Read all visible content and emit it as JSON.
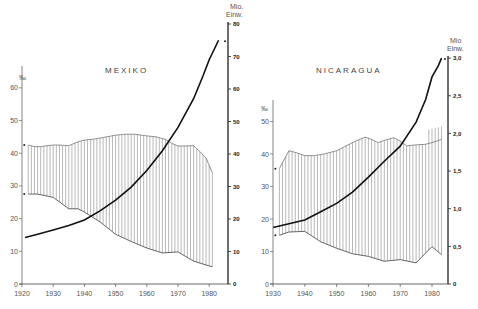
{
  "chart_data": [
    {
      "type": "line",
      "title": "MEXIKO",
      "xlabel": "",
      "ylabel_left": "‰",
      "ylabel_right": "Mio. Einw.",
      "x_ticks": [
        1920,
        1930,
        1940,
        1950,
        1960,
        1970,
        1980
      ],
      "y_left_ticks": [
        0,
        10,
        20,
        30,
        40,
        50,
        60
      ],
      "y_left_range": [
        0,
        60
      ],
      "y_right_ticks": [
        0,
        10,
        20,
        30,
        40,
        50,
        60,
        70,
        80
      ],
      "y_right_range": [
        0,
        80
      ],
      "grid": false,
      "fill_between": "vertical hatching between birth rate and death rate",
      "series": [
        {
          "name": "Geburtenrate (‰)",
          "axis": "left",
          "x": [
            1922,
            1924,
            1926,
            1928,
            1930,
            1932,
            1935,
            1938,
            1940,
            1943,
            1946,
            1950,
            1953,
            1956,
            1960,
            1963,
            1966,
            1968,
            1970,
            1972,
            1975,
            1977,
            1979,
            1981
          ],
          "y": [
            42.5,
            42,
            42,
            42.3,
            42.5,
            42.5,
            42.3,
            43.5,
            44,
            44.3,
            44.8,
            45.5,
            45.8,
            45.8,
            45.3,
            45,
            44.2,
            43,
            42.2,
            42.2,
            42.3,
            40.5,
            38.5,
            34
          ]
        },
        {
          "name": "Sterberate (‰)",
          "axis": "left",
          "x": [
            1922,
            1925,
            1930,
            1935,
            1938,
            1940,
            1945,
            1950,
            1955,
            1960,
            1965,
            1970,
            1975,
            1980,
            1981
          ],
          "y": [
            27.5,
            27.5,
            26.5,
            23,
            23,
            22,
            19,
            15.2,
            13,
            11,
            9.5,
            9.8,
            7,
            5.5,
            5.3
          ]
        },
        {
          "name": "Bevölkerung (Mio. Einw.)",
          "axis": "right",
          "x": [
            1921,
            1925,
            1930,
            1935,
            1940,
            1945,
            1950,
            1955,
            1960,
            1965,
            1970,
            1975,
            1978,
            1980,
            1983
          ],
          "y": [
            14.3,
            15.3,
            16.6,
            18.0,
            19.7,
            22.5,
            25.8,
            29.8,
            34.9,
            41,
            48.2,
            57,
            64,
            69,
            75
          ]
        }
      ]
    },
    {
      "type": "line",
      "title": "NICARAGUA",
      "xlabel": "",
      "ylabel_left": "‰",
      "ylabel_right": "Mio. Einw.",
      "x_ticks": [
        1930,
        1940,
        1950,
        1960,
        1970,
        1980
      ],
      "y_left_ticks": [
        0,
        10,
        20,
        30,
        40,
        50
      ],
      "y_left_range": [
        0,
        50
      ],
      "y_right_ticks": [
        "0",
        "0,5",
        "1,0",
        "1,5",
        "2,0",
        "2,5",
        "3,0"
      ],
      "y_right_range": [
        0,
        3.0
      ],
      "grid": false,
      "fill_between": "vertical hatching between birth rate and death rate",
      "series": [
        {
          "name": "Geburtenrate (‰)",
          "axis": "left",
          "x": [
            1932,
            1935,
            1937,
            1940,
            1943,
            1946,
            1950,
            1953,
            1956,
            1959,
            1961,
            1963,
            1966,
            1968,
            1970,
            1972,
            1975,
            1978,
            1980,
            1983
          ],
          "y": [
            35.5,
            41,
            40.5,
            39.5,
            39.5,
            40,
            41,
            42.5,
            44,
            45.2,
            44.5,
            43.5,
            44.5,
            45,
            44,
            42.5,
            42.8,
            43,
            43.5,
            44.5
          ]
        },
        {
          "name": "Geburtenrate (obere Schätzung, ‰)",
          "axis": "left",
          "x": [
            1979,
            1980,
            1981,
            1982,
            1983
          ],
          "y": [
            47.5,
            47.8,
            48,
            48.2,
            48.5
          ]
        },
        {
          "name": "Sterberate (‰)",
          "axis": "left",
          "x": [
            1932,
            1935,
            1940,
            1945,
            1950,
            1955,
            1960,
            1965,
            1970,
            1975,
            1980,
            1983
          ],
          "y": [
            15,
            16,
            16.2,
            13,
            11,
            9.3,
            8.5,
            7,
            7.5,
            6.5,
            11.5,
            9
          ]
        },
        {
          "name": "Bevölkerung (Mio. Einw.)",
          "axis": "right",
          "x": [
            1930,
            1935,
            1940,
            1945,
            1950,
            1955,
            1960,
            1965,
            1970,
            1975,
            1978,
            1979,
            1980,
            1982,
            1983
          ],
          "y": [
            0.75,
            0.8,
            0.85,
            0.96,
            1.07,
            1.22,
            1.42,
            1.63,
            1.83,
            2.15,
            2.45,
            2.6,
            2.75,
            2.9,
            3.0
          ]
        }
      ]
    }
  ],
  "labels": {
    "mexiko_title": "MEXIKO",
    "nicaragua_title": "NICARAGUA",
    "permille": "‰",
    "unit_line1": "Mio.",
    "unit_line2": "Einw.",
    "unit_line1_nic": "Mio",
    "unit_line2_nic": "Einw."
  }
}
